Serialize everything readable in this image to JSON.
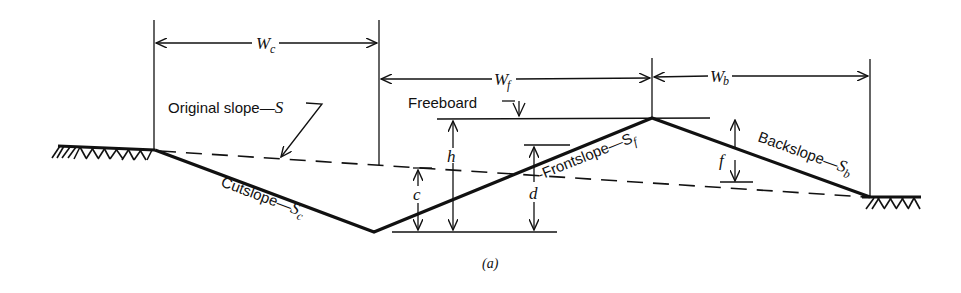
{
  "figure": {
    "caption": "(a)",
    "dimensions": {
      "wc": {
        "symbol": "W",
        "sub": "c"
      },
      "wf": {
        "symbol": "W",
        "sub": "f"
      },
      "wb": {
        "symbol": "W",
        "sub": "b"
      }
    },
    "labels": {
      "original_slope": "Original slope—",
      "original_slope_symbol": "S",
      "freeboard": "Freeboard",
      "cutslope": "Cutslope—",
      "cutslope_symbol": "S",
      "cutslope_sub": "c",
      "frontslope": "-Frontslope—S",
      "frontslope_sub": "f",
      "backslope": "Backslope—",
      "backslope_symbol": "S",
      "backslope_sub": "b"
    },
    "heights": {
      "h": "h",
      "c": "c",
      "d": "d",
      "f": "f"
    }
  },
  "colors": {
    "ink": "#111111",
    "background": "#ffffff"
  }
}
